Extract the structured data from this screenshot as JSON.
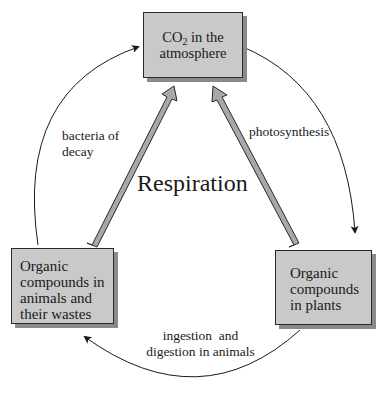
{
  "diagram": {
    "title": "Respiration",
    "nodes": {
      "co2": {
        "line1_prefix": "CO",
        "line1_sub": "2",
        "line1_suffix": " in the",
        "line2": "atmosphere"
      },
      "animals": {
        "lines": [
          "Organic",
          "compounds in",
          "animals and",
          "their wastes"
        ]
      },
      "plants": {
        "lines": [
          "Organic",
          "compounds",
          "in plants"
        ]
      }
    },
    "edges": {
      "photosynthesis": {
        "label": "photosynthesis",
        "from": "co2",
        "to": "plants"
      },
      "ingestion": {
        "label_line1": "ingestion  and",
        "label_line2": "digestion in animals",
        "from": "plants",
        "to": "animals"
      },
      "decay": {
        "label_line1": "bacteria of",
        "label_line2": "decay",
        "from": "animals",
        "to": "co2"
      },
      "respiration_animals": {
        "from": "animals",
        "to": "co2"
      },
      "respiration_plants": {
        "from": "plants",
        "to": "co2"
      }
    },
    "colors": {
      "box_fill": "#c9c9c9",
      "box_shadow": "#8a8a8a",
      "arrow_fill": "#a8a8a8",
      "line": "#1a1a1a"
    }
  }
}
